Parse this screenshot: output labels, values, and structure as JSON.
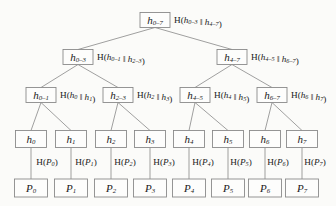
{
  "diagram": {
    "colors": {
      "background": "#fbfbf9",
      "box_fill": "#fdfdfc",
      "box_stroke": "#8a8a8a",
      "edge": "#8f8f8f",
      "text": "#1a1a1a"
    },
    "levels": [
      {
        "name": "root",
        "y": 20,
        "nodes": [
          {
            "id": "root",
            "x": 155,
            "label_base": "h",
            "label_sub": "0–7",
            "formula_prefix": "H(",
            "formula_a_base": "h",
            "formula_a_sub": "0–3",
            "formula_sep": " ‖ ",
            "formula_b_base": "h",
            "formula_b_sub": "4–7",
            "formula_suffix": ")"
          }
        ]
      },
      {
        "name": "level2",
        "y": 57,
        "nodes": [
          {
            "id": "h0-3",
            "x": 78,
            "label_base": "h",
            "label_sub": "0–3",
            "formula_prefix": "H(",
            "formula_a_base": "h",
            "formula_a_sub": "0–1",
            "formula_sep": " ‖ ",
            "formula_b_base": "h",
            "formula_b_sub": "2–3",
            "formula_suffix": ")"
          },
          {
            "id": "h4-7",
            "x": 232,
            "label_base": "h",
            "label_sub": "4–7",
            "formula_prefix": "H(",
            "formula_a_base": "h",
            "formula_a_sub": "4–5",
            "formula_sep": " ‖ ",
            "formula_b_base": "h",
            "formula_b_sub": "6–7",
            "formula_suffix": ")"
          }
        ]
      },
      {
        "name": "level3",
        "y": 95,
        "nodes": [
          {
            "id": "h0-1",
            "x": 41,
            "label_base": "h",
            "label_sub": "0–1",
            "formula_prefix": "H(",
            "formula_a_base": "h",
            "formula_a_sub": "0",
            "formula_sep": " ‖ ",
            "formula_b_base": "h",
            "formula_b_sub": "1",
            "formula_suffix": ")"
          },
          {
            "id": "h2-3",
            "x": 118,
            "label_base": "h",
            "label_sub": "2–3",
            "formula_prefix": "H(",
            "formula_a_base": "h",
            "formula_a_sub": "2",
            "formula_sep": " ‖ ",
            "formula_b_base": "h",
            "formula_b_sub": "3",
            "formula_suffix": ")"
          },
          {
            "id": "h4-5",
            "x": 195,
            "label_base": "h",
            "label_sub": "4–5",
            "formula_prefix": "H(",
            "formula_a_base": "h",
            "formula_a_sub": "4",
            "formula_sep": " ‖ ",
            "formula_b_base": "h",
            "formula_b_sub": "5",
            "formula_suffix": ")"
          },
          {
            "id": "h6-7",
            "x": 272,
            "label_base": "h",
            "label_sub": "6–7",
            "formula_prefix": "H(",
            "formula_a_base": "h",
            "formula_a_sub": "6",
            "formula_sep": " ‖ ",
            "formula_b_base": "h",
            "formula_b_sub": "7",
            "formula_suffix": ")"
          }
        ]
      }
    ],
    "leaf_hashes": {
      "name": "leaf-hash-row",
      "y": 139,
      "nodes": [
        {
          "id": "h0",
          "x": 31,
          "label_base": "h",
          "label_sub": "0"
        },
        {
          "id": "h1",
          "x": 71,
          "label_base": "h",
          "label_sub": "1"
        },
        {
          "id": "h2",
          "x": 111,
          "label_base": "h",
          "label_sub": "2"
        },
        {
          "id": "h3",
          "x": 150,
          "label_base": "h",
          "label_sub": "3"
        },
        {
          "id": "h4",
          "x": 189,
          "label_base": "h",
          "label_sub": "4"
        },
        {
          "id": "h5",
          "x": 228,
          "label_base": "h",
          "label_sub": "5"
        },
        {
          "id": "h6",
          "x": 265,
          "label_base": "h",
          "label_sub": "6"
        },
        {
          "id": "h7",
          "x": 302,
          "label_base": "h",
          "label_sub": "7"
        }
      ]
    },
    "hash_edge_labels": {
      "name": "hash-function-labels",
      "y": 163,
      "items": [
        {
          "id": "HP0",
          "x": 47,
          "prefix": "H(",
          "base": "P",
          "sub": "0",
          "suffix": ")"
        },
        {
          "id": "HP1",
          "x": 86,
          "prefix": "H(",
          "base": "P",
          "sub": "1",
          "suffix": ")"
        },
        {
          "id": "HP2",
          "x": 125,
          "prefix": "H(",
          "base": "P",
          "sub": "2",
          "suffix": ")"
        },
        {
          "id": "HP3",
          "x": 164,
          "prefix": "H(",
          "base": "P",
          "sub": "3",
          "suffix": ")"
        },
        {
          "id": "HP4",
          "x": 203,
          "prefix": "H(",
          "base": "P",
          "sub": "4",
          "suffix": ")"
        },
        {
          "id": "HP5",
          "x": 241,
          "prefix": "H(",
          "base": "P",
          "sub": "5",
          "suffix": ")"
        },
        {
          "id": "HP6",
          "x": 278,
          "prefix": "H(",
          "base": "P",
          "sub": "6",
          "suffix": ")"
        },
        {
          "id": "HP7",
          "x": 315,
          "prefix": "H(",
          "base": "P",
          "sub": "7",
          "suffix": ")"
        }
      ]
    },
    "data_blocks": {
      "name": "data-block-row",
      "y": 188,
      "nodes": [
        {
          "id": "P0",
          "x": 31,
          "label_base": "P",
          "label_sub": "0"
        },
        {
          "id": "P1",
          "x": 71,
          "label_base": "P",
          "label_sub": "1"
        },
        {
          "id": "P2",
          "x": 111,
          "label_base": "P",
          "label_sub": "2"
        },
        {
          "id": "P3",
          "x": 150,
          "label_base": "P",
          "label_sub": "3"
        },
        {
          "id": "P4",
          "x": 189,
          "label_base": "P",
          "label_sub": "4"
        },
        {
          "id": "P5",
          "x": 228,
          "label_base": "P",
          "label_sub": "5"
        },
        {
          "id": "P6",
          "x": 265,
          "label_base": "P",
          "label_sub": "6"
        },
        {
          "id": "P7",
          "x": 302,
          "label_base": "P",
          "label_sub": "7"
        }
      ]
    },
    "box_sizes": {
      "internal_w": 30,
      "internal_h": 15,
      "leaf_w": 31,
      "leaf_h": 17,
      "block_w": 33,
      "block_h": 18
    },
    "edges": [
      {
        "from": "root",
        "to": "h0-3"
      },
      {
        "from": "root",
        "to": "h4-7"
      },
      {
        "from": "h0-3",
        "to": "h0-1"
      },
      {
        "from": "h0-3",
        "to": "h2-3"
      },
      {
        "from": "h4-7",
        "to": "h4-5"
      },
      {
        "from": "h4-7",
        "to": "h6-7"
      },
      {
        "from": "h0-1",
        "to": "h0"
      },
      {
        "from": "h0-1",
        "to": "h1"
      },
      {
        "from": "h2-3",
        "to": "h2"
      },
      {
        "from": "h2-3",
        "to": "h3"
      },
      {
        "from": "h4-5",
        "to": "h4"
      },
      {
        "from": "h4-5",
        "to": "h5"
      },
      {
        "from": "h6-7",
        "to": "h6"
      },
      {
        "from": "h6-7",
        "to": "h7"
      },
      {
        "from": "h0",
        "to": "P0"
      },
      {
        "from": "h1",
        "to": "P1"
      },
      {
        "from": "h2",
        "to": "P2"
      },
      {
        "from": "h3",
        "to": "P3"
      },
      {
        "from": "h4",
        "to": "P4"
      },
      {
        "from": "h5",
        "to": "P5"
      },
      {
        "from": "h6",
        "to": "P6"
      },
      {
        "from": "h7",
        "to": "P7"
      }
    ]
  }
}
